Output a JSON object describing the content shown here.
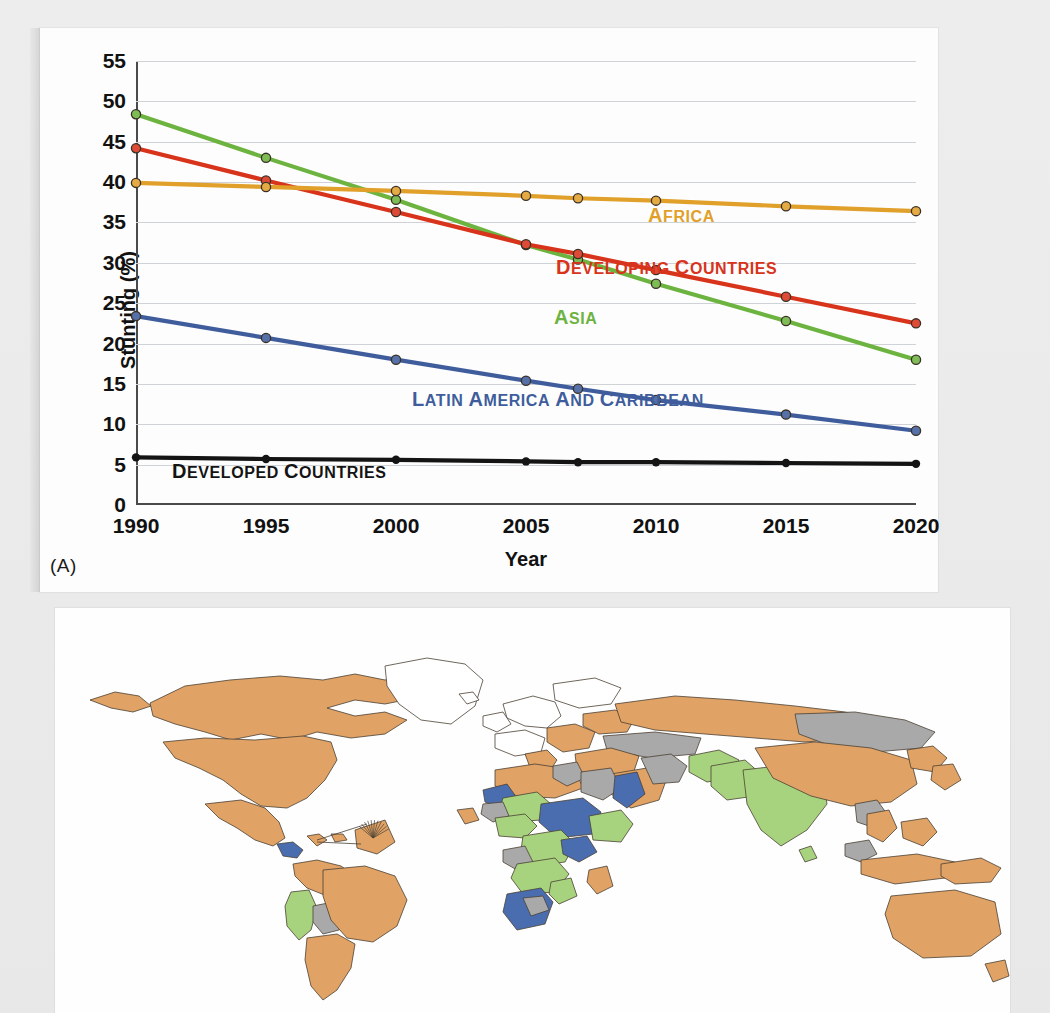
{
  "figure": {
    "panel_a_label": "(A)"
  },
  "chart_data": {
    "type": "line",
    "title": "",
    "xlabel": "Year",
    "ylabel": "Stunting (%)",
    "xlim": [
      1990,
      2020
    ],
    "ylim": [
      0,
      55
    ],
    "ytick_step": 5,
    "grid": true,
    "legend_position": "inline-annotations",
    "xticks": [
      "1990",
      "1995",
      "2000",
      "2005",
      "2010",
      "2015",
      "2020"
    ],
    "yticks": [
      "0",
      "5",
      "10",
      "15",
      "20",
      "25",
      "30",
      "35",
      "40",
      "45",
      "50",
      "55"
    ],
    "x": [
      1990,
      1995,
      2000,
      2005,
      2007,
      2010,
      2015,
      2020
    ],
    "series": [
      {
        "name": "Asia",
        "label": "Asia",
        "color": "#6cb33f",
        "values": [
          48.4,
          43.0,
          37.8,
          32.2,
          30.4,
          27.4,
          22.8,
          18.0
        ]
      },
      {
        "name": "Developing countries",
        "label": "Developing countries",
        "color": "#d8331b",
        "values": [
          44.2,
          40.2,
          36.3,
          32.3,
          31.1,
          29.1,
          25.8,
          22.5
        ]
      },
      {
        "name": "Africa",
        "label": "Africa",
        "color": "#e0a02a",
        "values": [
          39.9,
          39.4,
          38.9,
          38.3,
          38.0,
          37.7,
          37.0,
          36.4
        ]
      },
      {
        "name": "Latin America and Caribbean",
        "label": "Latin America and Caribbean",
        "color": "#3f5d9c",
        "values": [
          23.4,
          20.7,
          18.0,
          15.4,
          14.4,
          13.0,
          11.2,
          9.2
        ]
      },
      {
        "name": "Developed countries",
        "label": "Developed countries",
        "color": "#141414",
        "values": [
          5.9,
          5.7,
          5.6,
          5.4,
          5.3,
          5.3,
          5.2,
          5.1
        ]
      }
    ],
    "annotations": [
      {
        "text": "Africa",
        "color": "#e0a02a",
        "x_px": 608,
        "y_px": 176
      },
      {
        "text": "Developing countries",
        "color": "#d8331b",
        "x_px": 516,
        "y_px": 228
      },
      {
        "text": "Asia",
        "color": "#6cb33f",
        "x_px": 514,
        "y_px": 278
      },
      {
        "text": "Latin America and Caribbean",
        "color": "#3f5d9c",
        "x_px": 372,
        "y_px": 360
      },
      {
        "text": "Developed countries",
        "color": "#141414",
        "x_px": 132,
        "y_px": 432
      }
    ]
  },
  "map": {
    "legend_colors": {
      "orange": "#e0a265",
      "green": "#a8d37e",
      "blue": "#4a6db0",
      "gray": "#a9a9a9",
      "white": "#ffffff"
    }
  }
}
